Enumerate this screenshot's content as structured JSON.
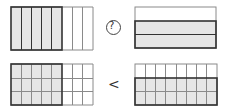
{
  "colors": {
    "shade": "#e6e6e6",
    "thin_line": "#8a8a8a",
    "thick_line": "#333333",
    "background": "#ffffff"
  },
  "top_row": {
    "left_model": {
      "columns": 8,
      "rows": 1,
      "shaded_columns": 5,
      "fraction": "5/8"
    },
    "comparison_symbol": "?",
    "right_model": {
      "columns": 1,
      "rows": 3,
      "shaded_rows": 2,
      "fraction": "2/3"
    }
  },
  "bottom_row": {
    "left_model": {
      "columns": 8,
      "rows": 3,
      "shaded_columns": 5,
      "fraction": "15/24"
    },
    "comparison_symbol": "<",
    "right_model": {
      "columns": 8,
      "rows": 3,
      "shaded_rows": 2,
      "fraction": "16/24"
    }
  }
}
